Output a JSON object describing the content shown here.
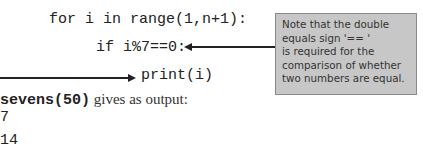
{
  "code": {
    "line_for": "for i in range(1,n+1):",
    "line_if": "if i%7==0:",
    "line_print": "print(i)"
  },
  "note": {
    "lines": [
      "Note that the double",
      "equals sign '== '",
      "is required for the",
      "comparison of whether",
      "two numbers are equal."
    ],
    "background": "#c7c7c7"
  },
  "output": {
    "call": "sevens(50)",
    "caption": " gives as output:",
    "values": [
      "7",
      "14"
    ]
  }
}
